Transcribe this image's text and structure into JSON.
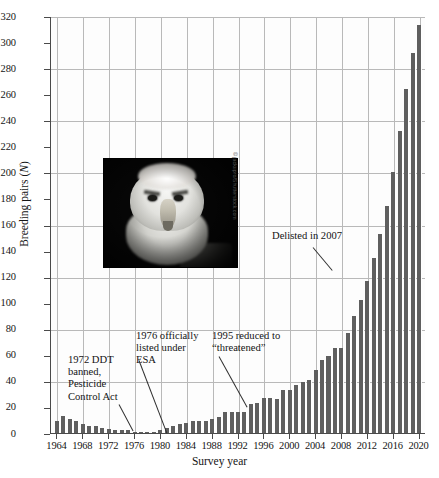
{
  "chart_data": {
    "type": "bar",
    "title": "",
    "xlabel": "Survey year",
    "ylabel": "Breeding pairs (N)",
    "ylabel_plain": "Breeding pairs",
    "ylabel_italic": "N",
    "ylim": [
      0,
      320
    ],
    "ytick_step": 20,
    "ygrid_step": 40,
    "grid": true,
    "legend": null,
    "xlim": [
      1963,
      2021
    ],
    "xtick_step": 4,
    "bar_color": "#5f5f5f",
    "yticks": [
      0,
      20,
      40,
      60,
      80,
      100,
      120,
      140,
      160,
      180,
      200,
      220,
      240,
      260,
      280,
      300,
      320
    ],
    "xticks": [
      1964,
      1968,
      1972,
      1976,
      1980,
      1984,
      1988,
      1992,
      1996,
      2000,
      2004,
      2008,
      2012,
      2016,
      2020
    ],
    "x": [
      1964,
      1965,
      1966,
      1967,
      1968,
      1969,
      1970,
      1971,
      1972,
      1973,
      1974,
      1975,
      1976,
      1977,
      1978,
      1979,
      1980,
      1981,
      1982,
      1983,
      1984,
      1985,
      1986,
      1987,
      1988,
      1989,
      1990,
      1991,
      1992,
      1993,
      1994,
      1995,
      1996,
      1997,
      1998,
      1999,
      2000,
      2001,
      2002,
      2003,
      2004,
      2005,
      2006,
      2007,
      2008,
      2009,
      2010,
      2011,
      2012,
      2013,
      2014,
      2015,
      2016,
      2017,
      2018,
      2019,
      2020
    ],
    "values": [
      9,
      13,
      11,
      9,
      7,
      5,
      5,
      4,
      3,
      2,
      2,
      2,
      1,
      1,
      1,
      1,
      2,
      4,
      5,
      7,
      8,
      9,
      9,
      9,
      11,
      12,
      16,
      16,
      16,
      16,
      22,
      23,
      27,
      27,
      26,
      33,
      33,
      37,
      39,
      41,
      48,
      56,
      59,
      65,
      65,
      77,
      90,
      102,
      117,
      134,
      153,
      174,
      200,
      232,
      264,
      292,
      313
    ],
    "annotations": [
      {
        "id": "ddt",
        "text": "1972 DDT banned, Pesticide Control Act",
        "x_year": 1972
      },
      {
        "id": "esa",
        "text": "1976 officially listed under ESA",
        "x_year": 1976
      },
      {
        "id": "threatened",
        "text": "1995 reduced to “threatened”",
        "x_year": 1995
      },
      {
        "id": "delisted",
        "text": "Delisted in 2007",
        "x_year": 2007
      }
    ]
  },
  "annotations": {
    "ddt": "1972 DDT\nbanned,\nPesticide\nControl Act",
    "esa": "1976 officially\nlisted under\nESA",
    "threatened": "1995 reduced to\n“threatened”",
    "delisted": "Delisted in 2007"
  },
  "photo": {
    "subject": "bald-eagle-head",
    "credit": "© jackupro/Shutterstock.com"
  }
}
